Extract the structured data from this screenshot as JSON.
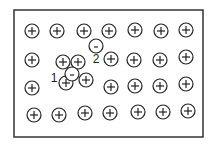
{
  "diagram": {
    "frame": {
      "x": 14,
      "y": 10,
      "w": 189,
      "h": 127,
      "stroke": "#333333"
    },
    "ion_radius": 7,
    "positive_ions": [
      {
        "x": 32,
        "y": 31
      },
      {
        "x": 57,
        "y": 31
      },
      {
        "x": 84,
        "y": 31
      },
      {
        "x": 109,
        "y": 31
      },
      {
        "x": 135,
        "y": 30
      },
      {
        "x": 161,
        "y": 31
      },
      {
        "x": 186,
        "y": 30
      },
      {
        "x": 32,
        "y": 60
      },
      {
        "x": 63,
        "y": 62
      },
      {
        "x": 78,
        "y": 62
      },
      {
        "x": 111,
        "y": 59
      },
      {
        "x": 134,
        "y": 60
      },
      {
        "x": 160,
        "y": 60
      },
      {
        "x": 186,
        "y": 57
      },
      {
        "x": 32,
        "y": 88
      },
      {
        "x": 66,
        "y": 83
      },
      {
        "x": 86,
        "y": 80
      },
      {
        "x": 111,
        "y": 87
      },
      {
        "x": 135,
        "y": 86
      },
      {
        "x": 160,
        "y": 86
      },
      {
        "x": 186,
        "y": 84
      },
      {
        "x": 34,
        "y": 115
      },
      {
        "x": 59,
        "y": 115
      },
      {
        "x": 85,
        "y": 113
      },
      {
        "x": 110,
        "y": 113
      },
      {
        "x": 138,
        "y": 112
      },
      {
        "x": 163,
        "y": 112
      },
      {
        "x": 188,
        "y": 111
      }
    ],
    "positive_symbol": "+",
    "negative_charges": [
      {
        "x": 96,
        "y": 46,
        "symbol": "-"
      },
      {
        "x": 72,
        "y": 74,
        "symbol": "-"
      }
    ],
    "labels": [
      {
        "text": "1",
        "x": 54,
        "y": 82
      },
      {
        "text": "2",
        "x": 96,
        "y": 63
      }
    ]
  }
}
